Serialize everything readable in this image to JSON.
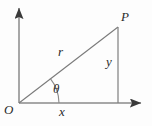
{
  "figure": {
    "kind": "polar-coordinates-right-triangle-diagram",
    "background_color": "#fdfdfd",
    "stroke_color": "#6e6e6e",
    "label_color": "#2b2b2b",
    "width": 152,
    "height": 126,
    "labels": {
      "point_P": "P",
      "radius_r": "r",
      "vertical_leg_y": "y",
      "horizontal_leg_x": "x",
      "origin_O": "O",
      "angle_theta": "θ"
    },
    "geometry": {
      "origin": {
        "x": 19,
        "y": 103
      },
      "point_P": {
        "x": 118,
        "y": 27
      },
      "foot_of_perpendicular": {
        "x": 118,
        "y": 103
      },
      "y_axis_tip": {
        "x": 19,
        "y": 4
      },
      "x_axis_tip": {
        "x": 146,
        "y": 103
      },
      "vector_arrow_tip": {
        "x": 70,
        "y": 64
      },
      "angle_arc_radius": 40
    }
  }
}
